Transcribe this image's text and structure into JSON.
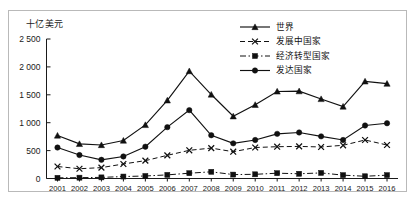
{
  "chart_data": {
    "type": "line",
    "title": "十亿美元",
    "xlabel": "",
    "ylabel": "十亿美元",
    "ylim": [
      0,
      2500
    ],
    "yticks": [
      "0",
      "500",
      "1 000",
      "1 500",
      "2 000",
      "2 500"
    ],
    "ytick_values": [
      0,
      500,
      1000,
      1500,
      2000,
      2500
    ],
    "grid": false,
    "legend_position": "top-right",
    "categories": [
      "2001",
      "2002",
      "2003",
      "2004",
      "2005",
      "2006",
      "2007",
      "2008",
      "2009",
      "2010",
      "2011",
      "2012",
      "2013",
      "2014",
      "2015",
      "2016"
    ],
    "series": [
      {
        "name": "世界",
        "marker": "triangle",
        "linestyle": "solid",
        "color": "#111111",
        "values": [
          770,
          620,
          600,
          680,
          960,
          1400,
          1925,
          1505,
          1115,
          1320,
          1560,
          1565,
          1425,
          1290,
          1740,
          1700
        ]
      },
      {
        "name": "发展中国家",
        "marker": "x",
        "linestyle": "dashed",
        "color": "#111111",
        "values": [
          215,
          175,
          195,
          260,
          320,
          415,
          505,
          545,
          480,
          555,
          570,
          575,
          565,
          595,
          690,
          600
        ]
      },
      {
        "name": "经济转型国家",
        "marker": "square",
        "linestyle": "dashdot",
        "color": "#111111",
        "values": [
          12,
          15,
          20,
          35,
          45,
          65,
          95,
          120,
          70,
          75,
          95,
          85,
          100,
          60,
          40,
          60
        ]
      },
      {
        "name": "发达国家",
        "marker": "circle",
        "linestyle": "solid",
        "color": "#111111",
        "values": [
          555,
          420,
          335,
          395,
          570,
          920,
          1225,
          775,
          630,
          690,
          800,
          825,
          755,
          690,
          950,
          990
        ]
      }
    ]
  },
  "legend": {
    "items": [
      {
        "label": "世界",
        "marker": "triangle",
        "linestyle": "solid"
      },
      {
        "label": "发展中国家",
        "marker": "x",
        "linestyle": "dashed"
      },
      {
        "label": "经济转型国家",
        "marker": "square",
        "linestyle": "dashdot"
      },
      {
        "label": "发达国家",
        "marker": "circle",
        "linestyle": "solid"
      }
    ]
  }
}
